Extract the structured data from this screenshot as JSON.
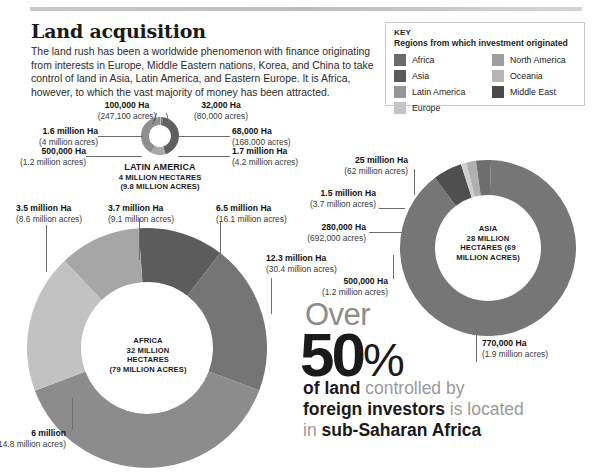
{
  "page_title": "Land acquisition",
  "deck": "The land rush has been a worldwide phenomenon with finance originating from interests in Europe, Middle Eastern nations, Korea, and China to take control of land in Asia, Latin America, and Eastern Europe. It is Africa, however, to which the vast majority of money has been attracted.",
  "key": {
    "title": "KEY",
    "subtitle": "Regions from which investment originated",
    "items": [
      {
        "label": "Africa",
        "color": "#6b6b6b"
      },
      {
        "label": "Asia",
        "color": "#5a5a5a"
      },
      {
        "label": "Latin America",
        "color": "#969696"
      },
      {
        "label": "Europe",
        "color": "#c4c4c4"
      },
      {
        "label": "North America",
        "color": "#9e9e9e"
      },
      {
        "label": "Oceania",
        "color": "#b5b5b5"
      },
      {
        "label": "Middle East",
        "color": "#4a4a4a"
      }
    ]
  },
  "chart_data": [
    {
      "type": "pie",
      "title": "LATIN AMERICA",
      "center_label": "LATIN AMERICA\n4 MILLION HECTARES\n(9.8 MILLION ACRES)",
      "total_hectares": "4 MILLION HECTARES",
      "total_acres": "(9.8 MILLION ACRES)",
      "categories": [
        "100,000 Ha",
        "32,000 Ha",
        "68,000 Ha",
        "1.7 million Ha",
        "500,000 Ha",
        "1.6 million Ha"
      ],
      "values": [
        0.1,
        0.032,
        0.068,
        1.7,
        0.5,
        1.6
      ],
      "unit": "million hectares",
      "segments": [
        {
          "ha": "100,000 Ha",
          "acres": "(247,100 acres)",
          "value": 0.1,
          "color": "#8a8a8a"
        },
        {
          "ha": "32,000 Ha",
          "acres": "(80,000 acres)",
          "value": 0.032,
          "color": "#b9b9b9"
        },
        {
          "ha": "68,000 Ha",
          "acres": "(168,000 acres)",
          "value": 0.068,
          "color": "#6f6f6f"
        },
        {
          "ha": "1.7 million Ha",
          "acres": "(4.2 million acres)",
          "value": 1.7,
          "color": "#5f5f5f"
        },
        {
          "ha": "500,000 Ha",
          "acres": "(1.2 million acres)",
          "value": 0.5,
          "color": "#a8a8a8"
        },
        {
          "ha": "1.6 million Ha",
          "acres": "(4 million acres)",
          "value": 1.6,
          "color": "#8f8f8f"
        }
      ]
    },
    {
      "type": "pie",
      "title": "AFRICA",
      "center_label": "AFRICA\n32 MILLION\nHECTARES\n(79 MILLION ACRES)",
      "total_hectares": "32 MILLION HECTARES",
      "total_acres": "(79 MILLION ACRES)",
      "categories": [
        "3.7 million Ha",
        "6.5 million Ha",
        "12.3 million Ha",
        "6 million",
        "3.5 million Ha"
      ],
      "values": [
        3.7,
        6.5,
        12.3,
        6.0,
        3.5
      ],
      "unit": "million hectares",
      "segments": [
        {
          "ha": "3.7 million Ha",
          "acres": "(9.1 million acres)",
          "value": 3.7,
          "color": "#5c5c5c"
        },
        {
          "ha": "6.5 million Ha",
          "acres": "(16.1 million acres)",
          "value": 6.5,
          "color": "#757575"
        },
        {
          "ha": "12.3 million Ha",
          "acres": "(30.4 million acres)",
          "value": 12.3,
          "color": "#8c8c8c"
        },
        {
          "ha": "6 million",
          "acres": "(14.8 million acres)",
          "value": 6.0,
          "color": "#c2c2c2"
        },
        {
          "ha": "3.5 million Ha",
          "acres": "(8.6 million acres)",
          "value": 3.5,
          "color": "#a6a6a6"
        }
      ]
    },
    {
      "type": "pie",
      "title": "ASIA",
      "center_label": "ASIA\n28 MILLION\nHECTARES (69\nMILLION ACRES)",
      "total_hectares": "28 MILLION HECTARES",
      "total_acres": "(69 MILLION ACRES)",
      "categories": [
        "25 million Ha",
        "1.5 million Ha",
        "280,000 Ha",
        "500,000 Ha",
        "770,000 Ha"
      ],
      "values": [
        25.0,
        1.5,
        0.28,
        0.5,
        0.77
      ],
      "unit": "million hectares",
      "segments": [
        {
          "ha": "25 million Ha",
          "acres": "(62 million acres)",
          "value": 25.0,
          "color": "#767676"
        },
        {
          "ha": "1.5 million Ha",
          "acres": "(3.7 million acres)",
          "value": 1.5,
          "color": "#4f4f4f"
        },
        {
          "ha": "280,000 Ha",
          "acres": "(692,000 acres)",
          "value": 0.28,
          "color": "#cfcfcf"
        },
        {
          "ha": "500,000 Ha",
          "acres": "(1.2 million acres)",
          "value": 0.5,
          "color": "#b0b0b0"
        },
        {
          "ha": "770,000 Ha",
          "acres": "(1.9 million acres)",
          "value": 0.77,
          "color": "#6e6e6e"
        }
      ]
    }
  ],
  "latin": {
    "center_1": "LATIN AMERICA",
    "center_2": "4 MILLION HECTARES",
    "center_3": "(9.8 MILLION ACRES)",
    "l_100k_ha": "100,000 Ha",
    "l_100k_ac": "(247,100 acres)",
    "l_32k_ha": "32,000 Ha",
    "l_32k_ac": "(80,000 acres)",
    "l_16m_ha": "1.6 million Ha",
    "l_16m_ac": "(4 million acres)",
    "l_68k_ha": "68,000 Ha",
    "l_68k_ac": "(168,000 acres)",
    "l_500k_ha": "500,000 Ha",
    "l_500k_ac": "(1.2 million acres)",
    "l_17m_ha": "1.7 million Ha",
    "l_17m_ac": "(4.2 million acres)"
  },
  "africa": {
    "center_1": "AFRICA",
    "center_2": "32 MILLION",
    "center_3": "HECTARES",
    "center_4": "(79 MILLION ACRES)",
    "a_35_ha": "3.5 million Ha",
    "a_35_ac": "(8.6 million acres)",
    "a_37_ha": "3.7 million Ha",
    "a_37_ac": "(9.1 million acres)",
    "a_65_ha": "6.5 million Ha",
    "a_65_ac": "(16.1 million acres)",
    "a_123_ha": "12.3 million Ha",
    "a_123_ac": "(30.4 million acres)",
    "a_6_ha": "6 million",
    "a_6_ac": "(14.8 million acres)"
  },
  "asia": {
    "center_1": "ASIA",
    "center_2": "28 MILLION",
    "center_3": "HECTARES (69",
    "center_4": "MILLION ACRES)",
    "s_25_ha": "25 million Ha",
    "s_25_ac": "(62 million acres)",
    "s_15_ha": "1.5 million Ha",
    "s_15_ac": "(3.7 million acres)",
    "s_280_ha": "280,000 Ha",
    "s_280_ac": "(692,000 acres)",
    "s_500_ha": "500,000 Ha",
    "s_500_ac": "(1.2 million acres)",
    "s_770_ha": "770,000 Ha",
    "s_770_ac": "(1.9 million acres)"
  },
  "statement": {
    "over": "Over",
    "fifty": "50",
    "percent": "%",
    "line1_bold": "of land",
    "line1_rest": " controlled by",
    "line2_bold": "foreign investors",
    "line2_rest": " is located",
    "line3_rest": "in ",
    "line3_bold": "sub-Saharan Africa"
  }
}
